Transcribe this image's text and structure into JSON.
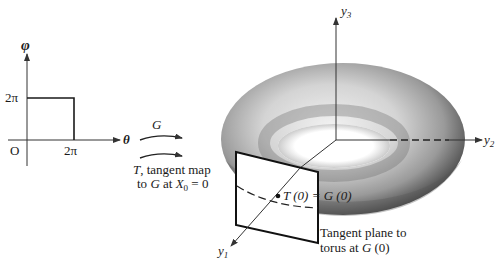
{
  "domain_graph": {
    "vertical_axis_label": "φ",
    "horizontal_axis_label": "θ",
    "origin_label": "O",
    "y_tick_label": "2π",
    "x_tick_label": "2π"
  },
  "maps": {
    "G_label": "G",
    "T_label_line1_var": "T",
    "T_label_line1_rest": ", tangent map",
    "T_label_line2_pre": "to ",
    "T_label_line2_G": "G",
    "T_label_line2_mid": " at ",
    "T_label_line2_X": "X",
    "T_label_line2_sub": "0",
    "T_label_line2_post": " = 0"
  },
  "torus_figure": {
    "axes": {
      "y1": {
        "letter": "y",
        "sub": "1"
      },
      "y2": {
        "letter": "y",
        "sub": "2"
      },
      "y3": {
        "letter": "y",
        "sub": "3"
      }
    },
    "point_label": "T (0) = G (0)",
    "plane_caption_line1": "Tangent plane to",
    "plane_caption_line2_pre": "torus at ",
    "plane_caption_line2_G": "G",
    "plane_caption_line2_post": " (0)"
  },
  "colors": {
    "ink": "#1a1a1a",
    "torus_dark": "#3a3a3a",
    "torus_light": "#d8d8d8",
    "background": "#ffffff"
  }
}
